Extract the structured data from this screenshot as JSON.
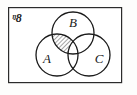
{
  "figure": {
    "kind": "venn-diagram",
    "universe": {
      "symbol": "ᵑ8",
      "name": "universal-set",
      "x": 17,
      "y": 19
    },
    "frame": {
      "x": 8,
      "y": 7,
      "width": 114,
      "height": 76,
      "stroke": "#2b2b2b",
      "stroke_width": 1.2,
      "fill": "#ffffff"
    },
    "circles": [
      {
        "id": "B",
        "label": "B",
        "cx": 73,
        "cy": 33,
        "r": 21,
        "label_x": 73,
        "label_y": 24
      },
      {
        "id": "A",
        "label": "A",
        "cx": 57,
        "cy": 55,
        "r": 21,
        "label_x": 47,
        "label_y": 60
      },
      {
        "id": "C",
        "label": "C",
        "cx": 89,
        "cy": 55,
        "r": 21,
        "label_x": 99,
        "label_y": 60
      }
    ],
    "shaded_region": {
      "description": "A ∩ B, excluding C",
      "sets_included": [
        "A",
        "B"
      ],
      "sets_excluded": [
        "C"
      ],
      "pattern": "diagonal-hatch",
      "hatch_angle_deg": 45,
      "hatch_spacing": 3,
      "hatch_color": "#2b2b2b",
      "fill": "#ffffff"
    },
    "stroke_color": "#1a1a1a",
    "circle_stroke_width": 1.3
  }
}
